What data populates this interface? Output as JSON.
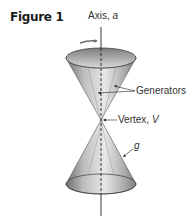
{
  "figure": {
    "title": "Figure 1",
    "labels": {
      "axis_prefix": "Axis, ",
      "axis_var": "a",
      "generators": "Generators",
      "vertex_prefix": "Vertex, ",
      "vertex_var": "V",
      "generator_var": "g"
    },
    "colors": {
      "cone_light": "#e6e6e6",
      "cone_dark": "#8c8c8c",
      "rim": "#3a3a3a",
      "arrow": "#6b6b6b"
    }
  }
}
